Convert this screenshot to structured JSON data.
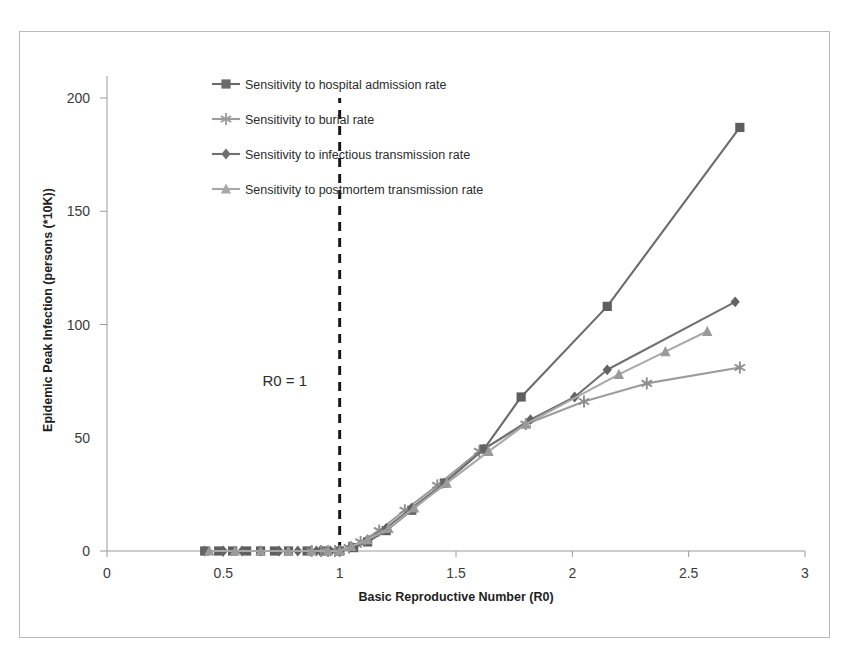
{
  "chart_data": {
    "type": "line",
    "title": "",
    "xlabel": "Basic Reproductive Number (R0)",
    "ylabel": "Epidemic Peak Infection (persons (*10K))",
    "xlim": [
      0,
      3
    ],
    "ylim": [
      0,
      215
    ],
    "xticks": [
      0,
      0.5,
      1,
      1.5,
      2,
      2.5,
      3
    ],
    "xtick_labels": [
      "0",
      "0.5",
      "1",
      "1.5",
      "2",
      "2.5",
      "3"
    ],
    "yticks": [
      0,
      50,
      100,
      150,
      200
    ],
    "ytick_labels": [
      "0",
      "50",
      "100",
      "150",
      "200"
    ],
    "grid": false,
    "legend_position": "upper-left-inside",
    "annotations": [
      {
        "text": "R0 = 1",
        "x": 0.86,
        "y": 73,
        "kind": "threshold-label"
      }
    ],
    "reference_lines": [
      {
        "orientation": "vertical",
        "x": 1.0,
        "style": "dashed",
        "color": "#1a1a1a",
        "y_from": 0,
        "y_to": 200
      }
    ],
    "series": [
      {
        "name": "Sensitivity to hospital admission rate",
        "marker": "square",
        "color": "#6b6b6b",
        "marker_color": "#5e5e5e",
        "points": [
          [
            0.42,
            0
          ],
          [
            0.48,
            0
          ],
          [
            0.54,
            0
          ],
          [
            0.6,
            0
          ],
          [
            0.66,
            0
          ],
          [
            0.72,
            0
          ],
          [
            0.78,
            0
          ],
          [
            0.86,
            0
          ],
          [
            0.93,
            0
          ],
          [
            1.0,
            0
          ],
          [
            1.06,
            1.5
          ],
          [
            1.12,
            4
          ],
          [
            1.2,
            9
          ],
          [
            1.31,
            18
          ],
          [
            1.45,
            30
          ],
          [
            1.62,
            45
          ],
          [
            1.78,
            68
          ],
          [
            2.15,
            108
          ],
          [
            2.72,
            187
          ]
        ]
      },
      {
        "name": "Sensitivity to burial rate",
        "marker": "asterisk",
        "color": "#9c9c9c",
        "marker_color": "#8d8d8d",
        "points": [
          [
            0.88,
            0
          ],
          [
            0.92,
            0
          ],
          [
            0.95,
            0
          ],
          [
            0.98,
            0
          ],
          [
            1.0,
            0
          ],
          [
            1.04,
            1.5
          ],
          [
            1.09,
            4
          ],
          [
            1.17,
            9
          ],
          [
            1.28,
            18
          ],
          [
            1.42,
            29
          ],
          [
            1.6,
            44
          ],
          [
            1.8,
            56
          ],
          [
            2.05,
            66
          ],
          [
            2.32,
            74
          ],
          [
            2.72,
            81
          ]
        ]
      },
      {
        "name": "Sensitivity to infectious transmission rate",
        "marker": "diamond",
        "color": "#707070",
        "marker_color": "#636363",
        "points": [
          [
            0.42,
            0
          ],
          [
            0.5,
            0
          ],
          [
            0.58,
            0
          ],
          [
            0.66,
            0
          ],
          [
            0.74,
            0
          ],
          [
            0.82,
            0
          ],
          [
            0.9,
            0
          ],
          [
            0.96,
            0
          ],
          [
            1.0,
            0
          ],
          [
            1.05,
            2
          ],
          [
            1.12,
            5
          ],
          [
            1.2,
            10
          ],
          [
            1.31,
            19
          ],
          [
            1.45,
            30
          ],
          [
            1.62,
            45
          ],
          [
            1.82,
            58
          ],
          [
            2.01,
            68
          ],
          [
            2.15,
            80
          ],
          [
            2.7,
            110
          ]
        ]
      },
      {
        "name": "Sensitivity to postmortem transmission rate",
        "marker": "triangle",
        "color": "#a8a8a8",
        "marker_color": "#9a9a9a",
        "points": [
          [
            0.44,
            0
          ],
          [
            0.55,
            0
          ],
          [
            0.66,
            0
          ],
          [
            0.78,
            0
          ],
          [
            0.88,
            0
          ],
          [
            0.95,
            0
          ],
          [
            1.0,
            0
          ],
          [
            1.05,
            2
          ],
          [
            1.12,
            5
          ],
          [
            1.21,
            10
          ],
          [
            1.32,
            19
          ],
          [
            1.46,
            30
          ],
          [
            1.64,
            44
          ],
          [
            1.8,
            56
          ],
          [
            2.2,
            78
          ],
          [
            2.4,
            88
          ],
          [
            2.58,
            97
          ]
        ]
      }
    ]
  },
  "legend": {
    "entries": [
      {
        "label": "Sensitivity to hospital admission rate",
        "marker": "square",
        "color": "#6b6b6b"
      },
      {
        "label": "Sensitivity to burial rate",
        "marker": "asterisk",
        "color": "#9c9c9c"
      },
      {
        "label": "Sensitivity to infectious transmission rate",
        "marker": "diamond",
        "color": "#707070"
      },
      {
        "label": "Sensitivity to postmortem transmission rate",
        "marker": "triangle",
        "color": "#a8a8a8"
      }
    ]
  },
  "colors": {
    "frame_border": "#b9b9b9",
    "axis": "#9a9a9a",
    "background": "#ffffff",
    "text": "#2b2b2b"
  }
}
